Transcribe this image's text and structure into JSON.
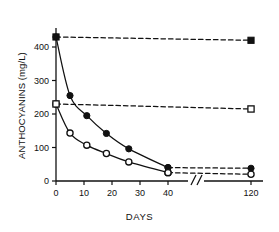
{
  "chart_data": {
    "type": "line",
    "title": "",
    "xlabel": "DAYS",
    "ylabel": "ANTHOCYANINS (mg/L)",
    "xlim": [
      0,
      120
    ],
    "ylim": [
      0,
      460
    ],
    "xticks": [
      0,
      10,
      20,
      30,
      40,
      120
    ],
    "xticklabels": [
      "0",
      "10",
      "20",
      "30",
      "40",
      "120"
    ],
    "yticks": [
      0,
      100,
      200,
      300,
      400
    ],
    "yticklabels": [
      "0",
      "100",
      "200",
      "300",
      "400"
    ],
    "grid": false,
    "legend": "none",
    "axis_break": {
      "between": [
        40,
        120
      ],
      "symbol": "//"
    },
    "series": [
      {
        "name": "filled-circle-solid",
        "marker": "filled-circle",
        "linestyle": "solid",
        "x": [
          0,
          5,
          11,
          18,
          26,
          40
        ],
        "y": [
          430,
          255,
          195,
          142,
          96,
          40
        ]
      },
      {
        "name": "open-circle-solid",
        "marker": "open-circle",
        "linestyle": "solid",
        "x": [
          0,
          5,
          11,
          18,
          26,
          40
        ],
        "y": [
          230,
          143,
          107,
          82,
          57,
          25
        ]
      },
      {
        "name": "filled-square-dashed",
        "marker": "filled-square",
        "linestyle": "dashed",
        "x": [
          0,
          120
        ],
        "y": [
          430,
          420
        ]
      },
      {
        "name": "open-square-dashed",
        "marker": "open-square",
        "linestyle": "dashed",
        "x": [
          0,
          120
        ],
        "y": [
          230,
          215
        ]
      },
      {
        "name": "filled-circle-dashed-tail",
        "marker": "filled-circle",
        "linestyle": "dashed",
        "x": [
          40,
          120
        ],
        "y": [
          40,
          38
        ]
      },
      {
        "name": "open-circle-dashed-tail",
        "marker": "open-circle",
        "linestyle": "dashed",
        "x": [
          40,
          120
        ],
        "y": [
          25,
          20
        ]
      }
    ],
    "colors": {
      "line": "#111111",
      "marker_fill": "#111111",
      "marker_open": "#ffffff",
      "axis": "#111111"
    }
  }
}
